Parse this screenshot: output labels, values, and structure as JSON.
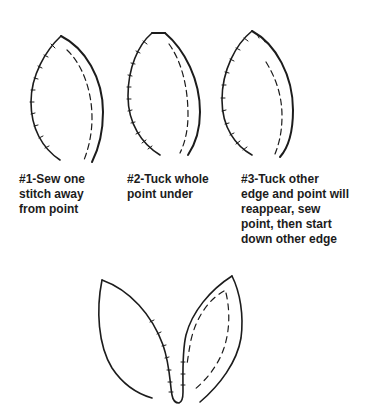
{
  "diagram": {
    "type": "sewing-instruction-illustration",
    "steps": [
      {
        "id": 1,
        "lines": [
          "#1-Sew one",
          "stitch away",
          "from point"
        ]
      },
      {
        "id": 2,
        "lines": [
          "#2-Tuck whole",
          "point under"
        ]
      },
      {
        "id": 3,
        "lines": [
          "#3-Tuck other",
          "edge and point will",
          "reappear, sew",
          "point, then start",
          "down other edge"
        ]
      }
    ],
    "colors": {
      "stroke": "#1c1c1c",
      "background": "#ffffff"
    }
  }
}
